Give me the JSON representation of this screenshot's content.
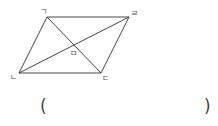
{
  "diagram": {
    "shape": "parallelogram",
    "vertices": [
      {
        "id": "top_left",
        "label": "ㄱ",
        "x": 47,
        "y": 17
      },
      {
        "id": "top_right",
        "label": "ㄹ",
        "x": 129,
        "y": 17
      },
      {
        "id": "bottom_left",
        "label": "ㄴ",
        "x": 19,
        "y": 73
      },
      {
        "id": "bottom_right",
        "label": "ㄷ",
        "x": 101,
        "y": 73
      }
    ],
    "intersection": {
      "label": "ㅁ",
      "x": 74,
      "y": 45
    },
    "stroke_color": "#333333"
  },
  "answer": {
    "open_paren": "(",
    "close_paren": ")",
    "value": ""
  }
}
